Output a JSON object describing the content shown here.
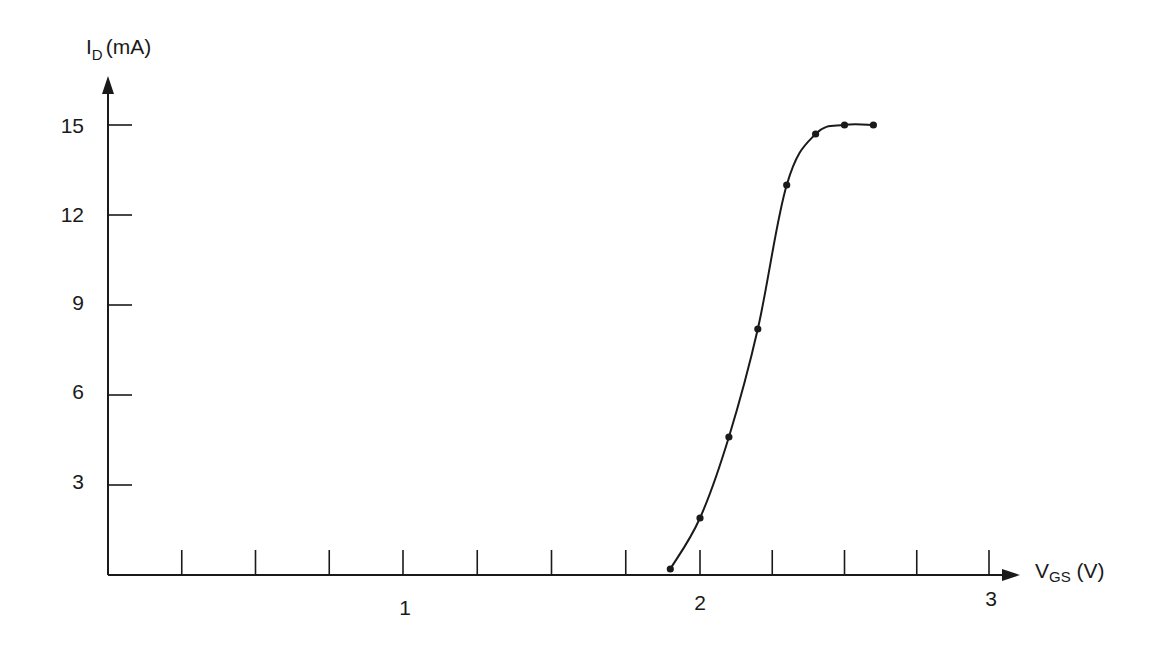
{
  "chart_data": {
    "type": "line",
    "title": "",
    "xlabel": "V_GS (V)",
    "ylabel": "I_D (mA)",
    "xlabel_parts": {
      "main": "V",
      "sub": "GS",
      "unit": " (V)"
    },
    "ylabel_parts": {
      "main": "I",
      "sub": "D",
      "unit": "(mA)"
    },
    "xlim": [
      0,
      3.1
    ],
    "ylim": [
      0,
      16.5
    ],
    "x_ticks_labeled": [
      1,
      2,
      3
    ],
    "x_minor_tick_step": 0.25,
    "y_ticks_labeled": [
      3,
      6,
      9,
      12,
      15
    ],
    "grid": false,
    "legend": null,
    "series": [
      {
        "name": "I_D vs V_GS",
        "markers": true,
        "x": [
          1.9,
          2.0,
          2.1,
          2.2,
          2.3,
          2.4,
          2.5,
          2.6
        ],
        "y": [
          0.2,
          1.9,
          4.6,
          8.2,
          13.0,
          14.7,
          15.0,
          15.0
        ]
      }
    ]
  },
  "labels": {
    "y_ticks": [
      "15",
      "12",
      "9",
      "6",
      "3"
    ],
    "x_ticks": [
      "1",
      "2",
      "3"
    ]
  },
  "colors": {
    "ink": "#1a1a1a",
    "background": "#ffffff"
  }
}
